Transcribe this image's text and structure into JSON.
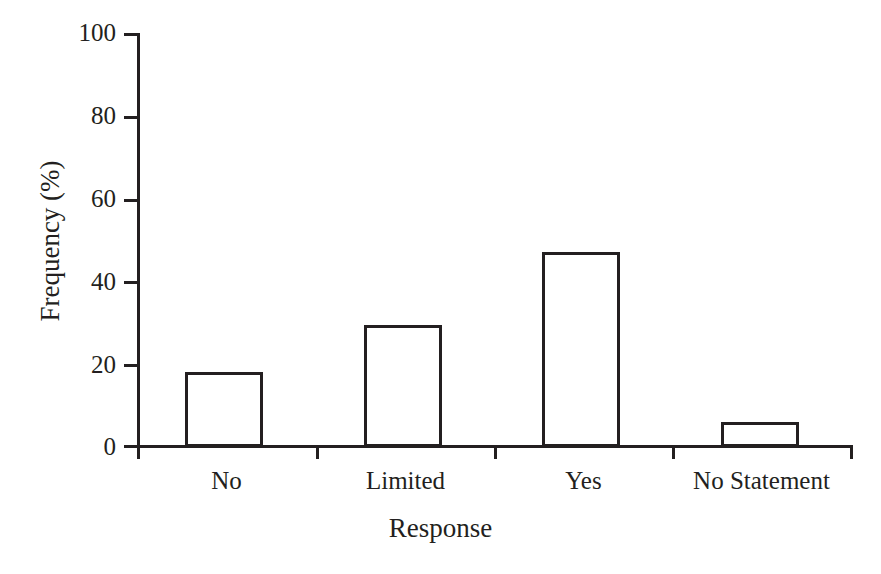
{
  "chart_data": {
    "type": "bar",
    "title": "",
    "xlabel": "Response",
    "ylabel": "Frequency (%)",
    "categories": [
      "No",
      "Limited",
      "Yes",
      "No Statement"
    ],
    "values": [
      18,
      29.5,
      47,
      6
    ],
    "ylim": [
      0,
      100
    ],
    "yticks": [
      0,
      20,
      40,
      60,
      80,
      100
    ],
    "ytick_labels": [
      "0",
      "20",
      "40",
      "60",
      "80",
      "100"
    ],
    "grid": false,
    "legend": false,
    "bar_style": {
      "fill": "#ffffff",
      "edge": "#231f20",
      "edge_width_px": 3
    },
    "background": "#ffffff",
    "series": [
      {
        "name": "Frequency",
        "values": [
          18,
          29.5,
          47,
          6
        ]
      }
    ]
  },
  "axes": {
    "y": {
      "ticks": [
        {
          "value": 100,
          "label": "100"
        },
        {
          "value": 80,
          "label": "80"
        },
        {
          "value": 60,
          "label": "60"
        },
        {
          "value": 40,
          "label": "40"
        },
        {
          "value": 20,
          "label": "20"
        },
        {
          "value": 0,
          "label": "0"
        }
      ],
      "title": "Frequency (%)"
    },
    "x": {
      "ticks": [
        {
          "label": "No"
        },
        {
          "label": "Limited"
        },
        {
          "label": "Yes"
        },
        {
          "label": "No Statement"
        }
      ],
      "title": "Response"
    }
  }
}
